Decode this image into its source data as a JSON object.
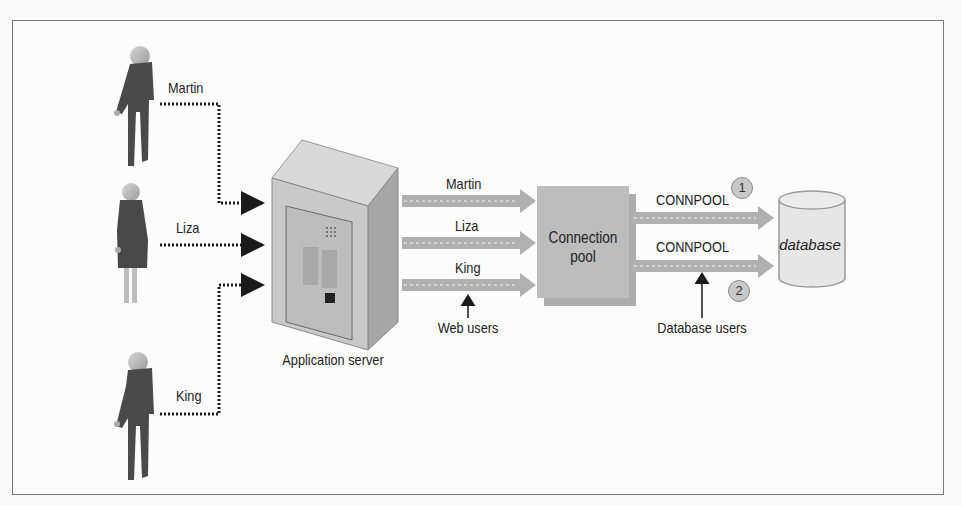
{
  "diagram": {
    "users": [
      {
        "name": "Martin",
        "role": "web user"
      },
      {
        "name": "Liza",
        "role": "web user"
      },
      {
        "name": "King",
        "role": "web user"
      }
    ],
    "app_server": {
      "label": "Application server"
    },
    "web_streams": [
      {
        "label": "Martin"
      },
      {
        "label": "Liza"
      },
      {
        "label": "King"
      }
    ],
    "web_users_caption": "Web users",
    "connection_pool": {
      "line1": "Connection",
      "line2": "pool"
    },
    "db_streams": [
      {
        "label": "CONNPOOL",
        "badge": "1"
      },
      {
        "label": "CONNPOOL",
        "badge": "2"
      }
    ],
    "database_users_caption": "Database users",
    "database": {
      "label": "database"
    },
    "colors": {
      "frame": "#7a7a7a",
      "person_body": "#4a4a4a",
      "person_head": "#b8b8b8",
      "server_face": "#c9c9c9",
      "pool_box": "#bdbdbd",
      "arrow_band": "#b0b0b0",
      "database": "#e6e6e6"
    }
  }
}
